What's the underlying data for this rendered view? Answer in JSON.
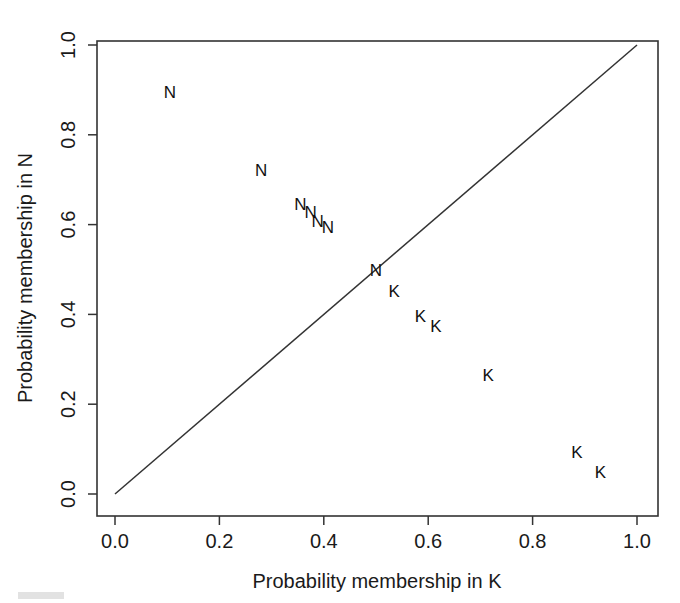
{
  "chart_data": {
    "type": "scatter",
    "title": "",
    "xlabel": "Probability membership in K",
    "ylabel": "Probability membership  in N",
    "xlim": [
      0.0,
      1.0
    ],
    "ylim": [
      0.0,
      1.0
    ],
    "grid": false,
    "legend": "none",
    "xticks": [
      "0.0",
      "0.2",
      "0.4",
      "0.6",
      "0.8",
      "1.0"
    ],
    "xtick_values": [
      0.0,
      0.2,
      0.4,
      0.6,
      0.8,
      1.0
    ],
    "yticks": [
      "0.0",
      "0.2",
      "0.4",
      "0.6",
      "0.8",
      "1.0"
    ],
    "ytick_values": [
      0.0,
      0.2,
      0.4,
      0.6,
      0.8,
      1.0
    ],
    "annotations": [
      {
        "name": "identity-line",
        "type": "line",
        "from": [
          0.0,
          0.0
        ],
        "to": [
          1.0,
          1.0
        ]
      }
    ],
    "series": [
      {
        "name": "N",
        "marker": "N",
        "color": "#111111",
        "points": [
          {
            "x": 0.105,
            "y": 0.895,
            "label": "N"
          },
          {
            "x": 0.28,
            "y": 0.72,
            "label": "N"
          },
          {
            "x": 0.355,
            "y": 0.645,
            "label": "N"
          },
          {
            "x": 0.375,
            "y": 0.628,
            "label": "N"
          },
          {
            "x": 0.388,
            "y": 0.606,
            "label": "N"
          },
          {
            "x": 0.408,
            "y": 0.593,
            "label": "N"
          },
          {
            "x": 0.5,
            "y": 0.497,
            "label": "N"
          }
        ]
      },
      {
        "name": "K",
        "marker": "K",
        "color": "#111111",
        "points": [
          {
            "x": 0.535,
            "y": 0.452,
            "label": "K"
          },
          {
            "x": 0.585,
            "y": 0.396,
            "label": "K"
          },
          {
            "x": 0.615,
            "y": 0.373,
            "label": "K"
          },
          {
            "x": 0.715,
            "y": 0.265,
            "label": "K"
          },
          {
            "x": 0.885,
            "y": 0.092,
            "label": "K"
          },
          {
            "x": 0.93,
            "y": 0.048,
            "label": "K"
          }
        ]
      }
    ]
  },
  "colors": {
    "axis": "#333333",
    "text": "#1a1a1a",
    "marker": "#111111",
    "background": "#ffffff"
  }
}
